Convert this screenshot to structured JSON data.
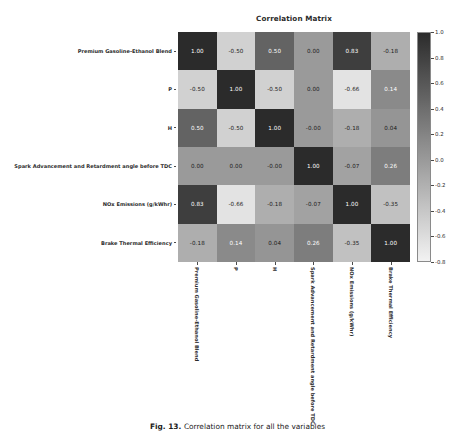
{
  "figure": {
    "title": "Correlation Matrix",
    "caption_bold": "Fig. 13.",
    "caption_rest": "Correlation matrix for all the variables"
  },
  "chart_data": {
    "type": "heatmap",
    "title": "Correlation Matrix",
    "xlabel": "",
    "ylabel": "",
    "grid": false,
    "legend_position": "right",
    "annotated": true,
    "annotation_format": "0.00",
    "colormap": "grayscale",
    "colorbar": {
      "vmin": -0.8,
      "vmax": 1.0,
      "ticks": [
        1.0,
        0.8,
        0.6,
        0.4,
        0.2,
        0.0,
        -0.2,
        -0.4,
        -0.6,
        -0.8
      ],
      "tick_labels": [
        "1.0",
        "0.8",
        "0.6",
        "0.4",
        "0.2",
        "0.0",
        "-0.2",
        "-0.4",
        "-0.6",
        "-0.8"
      ]
    },
    "categories": [
      "Premium Gasoline-Ethanol Blend",
      "P",
      "H",
      "Spark Advancement and Retardment angle before TDC",
      "NOx Emissions (g/kWhr)",
      "Brake Thermal Efficiency"
    ],
    "x_categories": [
      "Premium Gasoline-Ethanol Blend",
      "P",
      "H",
      "Spark Advancement and Retardment angle before TDC",
      "NOx Emissions (g/kWhr)",
      "Brake Thermal Efficiency"
    ],
    "y_categories": [
      "Premium Gasoline-Ethanol Blend",
      "P",
      "H",
      "Spark Advancement and Retardment angle before TDC",
      "NOx Emissions (g/kWhr)",
      "Brake Thermal Efficiency"
    ],
    "values": [
      [
        1.0,
        -0.5,
        0.5,
        0.0,
        0.83,
        -0.18
      ],
      [
        -0.5,
        1.0,
        -0.5,
        0.0,
        -0.66,
        0.14
      ],
      [
        0.5,
        -0.5,
        1.0,
        -0.0,
        -0.18,
        0.04
      ],
      [
        0.0,
        0.0,
        -0.0,
        1.0,
        -0.07,
        0.26
      ],
      [
        0.83,
        -0.66,
        -0.18,
        -0.07,
        1.0,
        -0.35
      ],
      [
        -0.18,
        0.14,
        0.04,
        0.26,
        -0.35,
        1.0
      ]
    ],
    "cell_labels": [
      [
        "1.00",
        "-0.50",
        "0.50",
        "0.00",
        "0.83",
        "-0.18"
      ],
      [
        "-0.50",
        "1.00",
        "-0.50",
        "0.00",
        "-0.66",
        "0.14"
      ],
      [
        "0.50",
        "-0.50",
        "1.00",
        "-0.00",
        "-0.18",
        "0.04"
      ],
      [
        "0.00",
        "0.00",
        "-0.00",
        "1.00",
        "-0.07",
        "0.26"
      ],
      [
        "0.83",
        "-0.66",
        "-0.18",
        "-0.07",
        "1.00",
        "-0.35"
      ],
      [
        "-0.18",
        "0.14",
        "0.04",
        "0.26",
        "-0.35",
        "1.00"
      ]
    ]
  }
}
